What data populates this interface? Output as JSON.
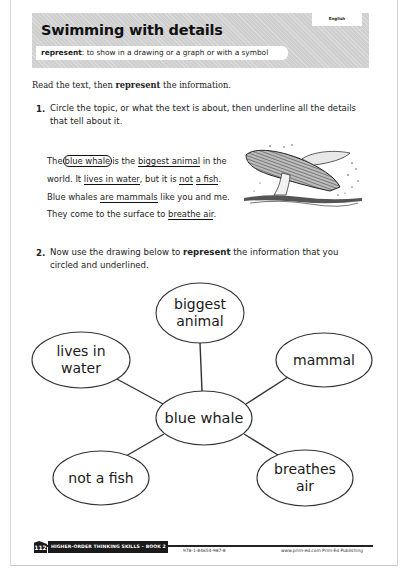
{
  "header": {
    "subject_tab": "English",
    "title": "Swimming with details",
    "vocab_term": "represent",
    "vocab_definition": ": to show in a drawing or a graph or with a symbol"
  },
  "instruction": {
    "prefix": "Read the text, then ",
    "bold": "represent",
    "suffix": " the information."
  },
  "questions": [
    {
      "number": "1.",
      "line1": "Circle the topic, or what the text is about, then underline all the details",
      "line2": "that tell about it."
    },
    {
      "number": "2.",
      "line1_prefix": "Now use the drawing below to ",
      "line1_bold": "represent",
      "line1_suffix": " the information that you",
      "line2": "circled and underlined."
    }
  ],
  "passage": {
    "t1": "The",
    "topic": "blue whale",
    "t2": "is the ",
    "d1": "biggest animal",
    "t3": " in the world. It ",
    "d2": "lives in water",
    "t4": ", but it is ",
    "d3a": "not",
    "d3b": "a fish",
    "t5": ". Blue whales ",
    "d4": "are mammals",
    "t6": " like you and me. They come to the surface to ",
    "d5": "breathe air",
    "t7": "."
  },
  "image": {
    "icon": "whale-breaching-illustration"
  },
  "diagram": {
    "center": "blue whale",
    "nodes": [
      {
        "id": "top",
        "line1": "biggest",
        "line2": "animal"
      },
      {
        "id": "left",
        "line1": "lives in",
        "line2": "water"
      },
      {
        "id": "right",
        "line1": "mammal",
        "line2": ""
      },
      {
        "id": "bottom-left",
        "line1": "not a fish",
        "line2": ""
      },
      {
        "id": "bottom-right",
        "line1": "breathes",
        "line2": "air"
      }
    ]
  },
  "footer": {
    "page_number": "112",
    "book_title": "HIGHER-ORDER THINKING SKILLS – BOOK 2",
    "isbn": "978-1-84654-987-8",
    "publisher": "www.prim-ed.com  Prim-Ed Publishing"
  },
  "colors": {
    "header_band": "#cfcfcf",
    "ink": "#1a1a1a",
    "footer_bar": "#1a1a1a"
  }
}
